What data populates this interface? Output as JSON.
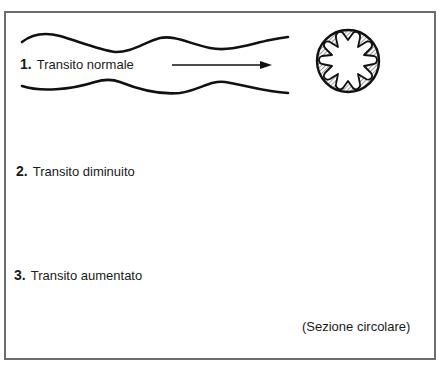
{
  "diagram": {
    "panels": [
      {
        "number": "1.",
        "label": "Transito normale",
        "arrow": "thin",
        "lumen": "moderately folded (8 folds)"
      },
      {
        "number": "2.",
        "label": "Transito diminuito",
        "arrow": "thin-short",
        "lumen": "deeply folded (8 folds)"
      },
      {
        "number": "3.",
        "label": "Transito aumentato",
        "arrow": "thick",
        "lumen": "nearly smooth (9 shallow folds)"
      }
    ],
    "caption": "(Sezione circolare)",
    "colors": {
      "ink": "#111111",
      "border": "#6d6d6d",
      "background": "#ffffff"
    }
  }
}
